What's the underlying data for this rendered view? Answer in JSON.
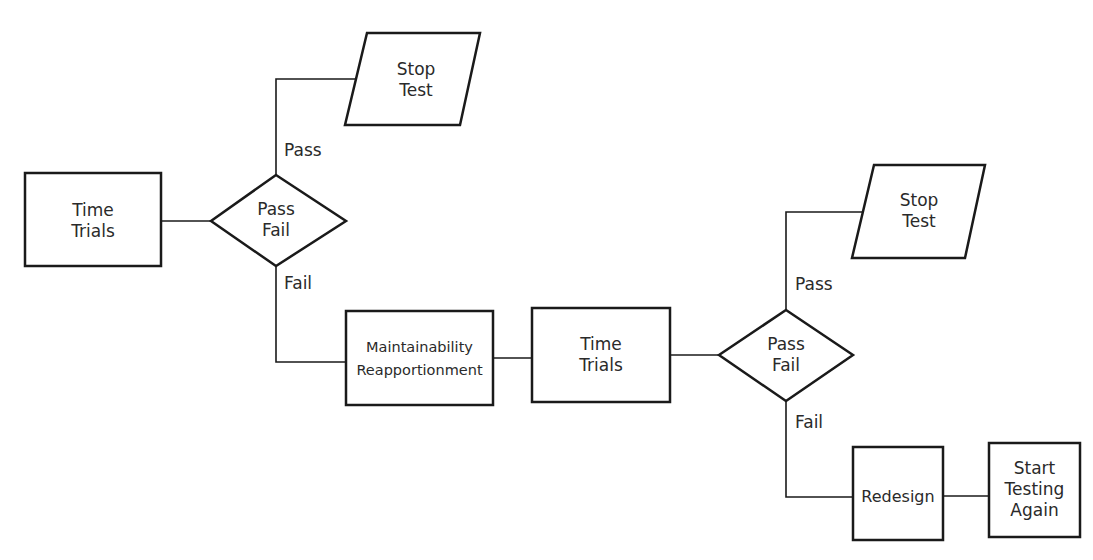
{
  "diagram": {
    "type": "flowchart",
    "nodes": [
      {
        "id": "time_trials_1",
        "shape": "rectangle",
        "line1": "Time",
        "line2": "Trials"
      },
      {
        "id": "decision_1",
        "shape": "diamond",
        "line1": "Pass",
        "line2": "Fail"
      },
      {
        "id": "stop_test_1",
        "shape": "parallelogram",
        "line1": "Stop",
        "line2": "Test"
      },
      {
        "id": "maintainability",
        "shape": "rectangle",
        "line1": "Maintainability",
        "line2": "Reapportionment"
      },
      {
        "id": "time_trials_2",
        "shape": "rectangle",
        "line1": "Time",
        "line2": "Trials"
      },
      {
        "id": "decision_2",
        "shape": "diamond",
        "line1": "Pass",
        "line2": "Fail"
      },
      {
        "id": "stop_test_2",
        "shape": "parallelogram",
        "line1": "Stop",
        "line2": "Test"
      },
      {
        "id": "redesign",
        "shape": "rectangle",
        "line1": "Redesign"
      },
      {
        "id": "start_testing_again",
        "shape": "rectangle",
        "line1": "Start",
        "line2": "Testing",
        "line3": "Again"
      }
    ],
    "edges": [
      {
        "from": "time_trials_1",
        "to": "decision_1",
        "label": ""
      },
      {
        "from": "decision_1",
        "to": "stop_test_1",
        "label": "Pass"
      },
      {
        "from": "decision_1",
        "to": "maintainability",
        "label": "Fail"
      },
      {
        "from": "maintainability",
        "to": "time_trials_2",
        "label": ""
      },
      {
        "from": "time_trials_2",
        "to": "decision_2",
        "label": ""
      },
      {
        "from": "decision_2",
        "to": "stop_test_2",
        "label": "Pass"
      },
      {
        "from": "decision_2",
        "to": "redesign",
        "label": "Fail"
      },
      {
        "from": "redesign",
        "to": "start_testing_again",
        "label": ""
      }
    ],
    "edge_labels": {
      "pass_1": "Pass",
      "fail_1": "Fail",
      "pass_2": "Pass",
      "fail_2": "Fail"
    },
    "stroke_color": "#1a1a1a",
    "background_color": "#ffffff"
  }
}
